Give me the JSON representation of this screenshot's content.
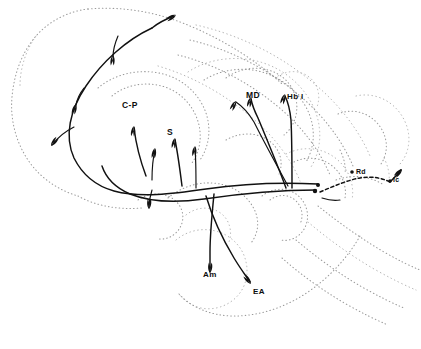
{
  "figure": {
    "kind": "neuroanatomical-sagittal-pathway-diagram",
    "background_color": "#ffffff",
    "outline_color": "#9a9a9a",
    "tract_color": "#111111",
    "width": 421,
    "height": 349
  },
  "labels": [
    {
      "id": "c-p",
      "text": "C-P",
      "x": 122,
      "y": 101,
      "size": "lg"
    },
    {
      "id": "s",
      "text": "S",
      "x": 167,
      "y": 128,
      "size": "lg"
    },
    {
      "id": "md",
      "text": "MD",
      "x": 246,
      "y": 91,
      "size": "lg"
    },
    {
      "id": "hb-l",
      "text": "Hb l",
      "x": 287,
      "y": 93,
      "size": "md"
    },
    {
      "id": "rd",
      "text": "Rd",
      "x": 356,
      "y": 168,
      "size": "sm"
    },
    {
      "id": "lc",
      "text": "lc",
      "x": 393,
      "y": 176,
      "size": "sm"
    },
    {
      "id": "am",
      "text": "Am",
      "x": 203,
      "y": 271,
      "size": "md"
    },
    {
      "id": "ea",
      "text": "EA",
      "x": 253,
      "y": 288,
      "size": "md"
    }
  ],
  "nuclei_abbreviations": [
    {
      "abbr": "C-P",
      "name": "caudate-putamen"
    },
    {
      "abbr": "S",
      "name": "septum"
    },
    {
      "abbr": "MD",
      "name": "mediodorsal thalamic nucleus"
    },
    {
      "abbr": "Hb l",
      "name": "lateral habenula"
    },
    {
      "abbr": "Rd",
      "name": "dorsal raphe nucleus"
    },
    {
      "abbr": "lc",
      "name": "locus coeruleus"
    },
    {
      "abbr": "Am",
      "name": "amygdala"
    },
    {
      "abbr": "EA",
      "name": "extended amygdala"
    }
  ],
  "outline_contours": [
    {
      "id": "cortex-outer-rostral",
      "d": "M 88 9 C 70 11 50 20 36 36 C 22 52 14 74 12 97 C 10 120 16 142 28 160 C 40 178 58 190 78 196"
    },
    {
      "id": "cortex-outer-dorsal",
      "d": "M 88 9 C 122 6 158 12 190 26 C 226 41 258 62 282 84"
    },
    {
      "id": "cortex-arc-1",
      "d": "M 196 25 C 236 34 274 52 306 77 C 336 100 358 128 370 156"
    },
    {
      "id": "cortex-arc-2",
      "d": "M 190 40 C 228 49 264 67 294 91 C 322 113 342 140 353 166"
    },
    {
      "id": "cortex-arc-3",
      "d": "M 178 55 C 214 64 248 82 276 105 C 302 126 320 151 330 175"
    },
    {
      "id": "cortex-arc-4",
      "d": "M 158 66 C 192 76 224 94 250 116 C 274 136 291 159 300 181"
    },
    {
      "id": "striatum-shell",
      "d": "M 98 88 C 112 76 132 70 152 72 C 174 74 192 86 202 104 C 212 122 211 144 200 160"
    },
    {
      "id": "striatum-core",
      "d": "M 112 96 C 124 86 141 82 157 85 C 175 88 189 100 196 116 C 203 132 201 150 192 163"
    },
    {
      "id": "thalamus-outer",
      "d": "M 188 72 C 206 60 230 56 252 60 C 278 65 300 81 312 104 C 323 125 322 149 311 167"
    },
    {
      "id": "thalamus-inner",
      "d": "M 204 80 C 220 70 240 67 258 71 C 280 76 297 90 307 109 C 316 127 315 147 306 162"
    },
    {
      "id": "md-nucleus",
      "d": "M 226 78 C 238 69 254 66 268 70 C 283 74 293 85 296 99 C 299 113 294 127 284 135"
    },
    {
      "id": "hb-nucleus",
      "d": "M 278 76 C 288 70 300 70 309 77 C 318 84 321 96 317 107"
    },
    {
      "id": "hypothalamus-base",
      "d": "M 168 198 C 180 188 196 182 212 183 C 230 184 245 193 253 207 C 260 219 259 233 251 243"
    },
    {
      "id": "hypo-lobe-left",
      "d": "M 138 200 C 148 193 160 192 170 197 C 180 202 185 213 182 223 C 179 233 169 240 159 239"
    },
    {
      "id": "hypo-lobe-mid",
      "d": "M 186 215 C 196 207 209 206 219 212 C 229 218 233 231 229 242"
    },
    {
      "id": "mammillary",
      "d": "M 262 196 C 272 188 286 187 296 194 C 306 201 310 214 306 225 C 302 236 291 242 281 240"
    },
    {
      "id": "mamm-inner",
      "d": "M 270 200 C 278 194 288 194 295 200 C 302 206 304 216 300 224"
    },
    {
      "id": "amygdala-outline",
      "d": "M 176 240 C 188 230 204 227 219 232 C 236 238 247 253 247 271 C 247 288 236 302 220 307 C 204 312 188 306 179 294"
    },
    {
      "id": "temporal-lobe",
      "d": "M 179 294 C 192 308 212 316 234 316 C 260 316 286 307 308 292 C 330 277 348 257 360 236"
    },
    {
      "id": "brainstem-1",
      "d": "M 318 206 C 338 222 360 238 384 252 C 398 260 410 266 420 270"
    },
    {
      "id": "brainstem-2",
      "d": "M 308 222 C 328 239 350 255 374 269 C 390 278 404 285 416 290"
    },
    {
      "id": "brainstem-3",
      "d": "M 296 240 C 316 257 338 273 362 287 C 378 296 392 303 404 308"
    },
    {
      "id": "brainstem-4",
      "d": "M 282 258 C 300 274 322 290 346 304 C 362 313 376 320 388 325"
    },
    {
      "id": "midbrain-outline",
      "d": "M 286 154 C 302 146 320 147 334 157 C 348 167 355 184 352 200"
    },
    {
      "id": "midbrain-inner",
      "d": "M 294 162 C 306 156 320 157 331 165 C 342 173 347 186 345 198"
    },
    {
      "id": "tectum",
      "d": "M 338 114 C 352 108 368 112 378 124 C 388 136 389 152 381 164"
    },
    {
      "id": "cerebellum-hint",
      "d": "M 356 96 C 374 92 392 100 402 116 C 412 132 411 151 400 164"
    },
    {
      "id": "pons-strip",
      "d": "M 336 180 C 352 174 370 176 384 185"
    },
    {
      "id": "rd-region",
      "d": "M 340 150 C 344 158 346 166 345 174"
    },
    {
      "id": "lc-region",
      "d": "M 384 158 C 388 166 390 174 389 182"
    },
    {
      "id": "ventricle-hint",
      "d": "M 226 140 C 240 132 256 132 268 140 C 280 148 284 162 279 174"
    },
    {
      "id": "lateral-edge",
      "d": "M 78 196 C 96 206 118 210 142 208"
    },
    {
      "id": "rostral-tip",
      "d": "M 36 36 C 26 50 20 68 20 86"
    }
  ],
  "tracts": [
    {
      "id": "mfb-main-ascending",
      "d": "M 318 184 C 280 182 240 184 206 189 C 172 194 140 198 114 191 C 96 186 82 174 74 158 C 64 136 70 110 86 86 C 102 62 126 40 152 28",
      "style": "solid"
    },
    {
      "id": "mfb-second-ascending",
      "d": "M 316 190 C 278 190 238 194 204 199 C 176 203 150 202 130 194 C 116 188 106 178 102 166",
      "style": "solid"
    },
    {
      "id": "cortical-branch-long",
      "d": "M 152 28 C 158 23 166 19 174 16",
      "style": "solid"
    },
    {
      "id": "cortical-branch-up",
      "d": "M 118 36 C 115 43 113 50 113 57",
      "style": "thin"
    },
    {
      "id": "cortical-branch-lat",
      "d": "M 84 88 C 80 93 77 99 76 105",
      "style": "thin"
    },
    {
      "id": "cortical-branch-vent",
      "d": "M 74 127 C 66 131 58 137 52 145",
      "style": "thin"
    },
    {
      "id": "cp-branch-1",
      "d": "M 146 176 C 140 160 136 144 134 128",
      "style": "solid"
    },
    {
      "id": "cp-branch-2",
      "d": "M 152 180 C 152 168 153 158 155 150",
      "style": "thin"
    },
    {
      "id": "s-branch-1",
      "d": "M 182 186 C 180 170 178 154 175 140",
      "style": "solid"
    },
    {
      "id": "s-branch-2",
      "d": "M 196 188 C 196 174 196 160 195 148",
      "style": "thin"
    },
    {
      "id": "vent-branch-down",
      "d": "M 152 190 C 150 196 149 202 149 208",
      "style": "thin"
    },
    {
      "id": "thalamic-md",
      "d": "M 286 188 C 278 166 268 142 258 118 C 254 110 252 104 251 99",
      "style": "solid"
    },
    {
      "id": "thalamic-md-2",
      "d": "M 288 186 C 276 164 264 142 254 122 C 248 112 242 106 236 102",
      "style": "thin"
    },
    {
      "id": "habenular",
      "d": "M 292 188 C 292 164 292 140 291 120 C 290 110 288 102 285 96",
      "style": "solid"
    },
    {
      "id": "amygdala-descend",
      "d": "M 214 194 C 212 214 210 234 210 252 C 210 260 210 266 210 272",
      "style": "solid"
    },
    {
      "id": "ea-descend",
      "d": "M 206 196 C 212 216 222 238 234 258 C 240 268 246 276 250 282",
      "style": "solid"
    },
    {
      "id": "raphe-dashed",
      "d": "M 320 192 C 334 186 348 180 360 178 C 372 176 382 178 390 182",
      "style": "dashed"
    },
    {
      "id": "lc-connector",
      "d": "M 390 182 C 394 178 398 174 401 170",
      "style": "solid"
    },
    {
      "id": "brainstem-short-1",
      "d": "M 322 198 C 328 200 334 201 340 200",
      "style": "thin"
    }
  ],
  "arrowheads": [
    {
      "id": "arrow-cortex-rostral",
      "x": 176,
      "y": 15,
      "angle": -28
    },
    {
      "id": "arrow-cortex-up",
      "x": 113,
      "y": 55,
      "angle": -86
    },
    {
      "id": "arrow-cortex-lat",
      "x": 76,
      "y": 104,
      "angle": -74
    },
    {
      "id": "arrow-cortex-vent",
      "x": 51,
      "y": 146,
      "angle": 128
    },
    {
      "id": "arrow-cp-1",
      "x": 134,
      "y": 126,
      "angle": -82
    },
    {
      "id": "arrow-cp-2",
      "x": 155,
      "y": 148,
      "angle": -80
    },
    {
      "id": "arrow-s-1",
      "x": 175,
      "y": 138,
      "angle": -80
    },
    {
      "id": "arrow-s-2",
      "x": 195,
      "y": 146,
      "angle": -84
    },
    {
      "id": "arrow-vent-down",
      "x": 149,
      "y": 209,
      "angle": 92
    },
    {
      "id": "arrow-md",
      "x": 251,
      "y": 97,
      "angle": -76
    },
    {
      "id": "arrow-md-2",
      "x": 236,
      "y": 101,
      "angle": -62
    },
    {
      "id": "arrow-hbl",
      "x": 285,
      "y": 94,
      "angle": -72
    },
    {
      "id": "arrow-am",
      "x": 210,
      "y": 273,
      "angle": 92
    },
    {
      "id": "arrow-ea",
      "x": 251,
      "y": 284,
      "angle": 52
    },
    {
      "id": "arrow-lc",
      "x": 402,
      "y": 169,
      "angle": -48
    }
  ],
  "nucleus_dots": [
    {
      "id": "dot-mfb-origin-1",
      "x": 318,
      "y": 185,
      "r": 2.0
    },
    {
      "id": "dot-mfb-origin-2",
      "x": 315,
      "y": 191,
      "r": 2.2
    },
    {
      "id": "dot-rd",
      "x": 352,
      "y": 172,
      "r": 1.8
    },
    {
      "id": "dot-lc",
      "x": 390,
      "y": 181,
      "r": 1.8
    }
  ]
}
